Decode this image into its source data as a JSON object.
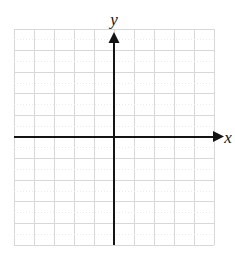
{
  "figure": {
    "name": "blank-cartesian-coordinate-plane",
    "background_color": "#ffffff"
  },
  "chart_data": {
    "type": "scatter",
    "title": "",
    "subtitle": "",
    "xlabel": "x",
    "ylabel": "y",
    "x": [],
    "y": [],
    "series": [],
    "annotations": [],
    "legend": null,
    "legend_position": "none",
    "grid": true,
    "grid_color": "#d8d8d8",
    "grid_step": 1,
    "axis_color": "#141414",
    "xlim": [
      -5,
      5
    ],
    "ylim": [
      -5,
      5
    ],
    "xticks": [
      -5,
      -4,
      -3,
      -2,
      -1,
      0,
      1,
      2,
      3,
      4,
      5
    ],
    "yticks": [
      -5,
      -4,
      -3,
      -2,
      -1,
      0,
      1,
      2,
      3,
      4,
      5
    ],
    "xtick_labels": [],
    "ytick_labels": [],
    "columns": 10,
    "rows": 10,
    "origin": {
      "x": 0,
      "y": 0
    },
    "arrows": {
      "x_positive": true,
      "y_positive": true
    }
  },
  "labels": {
    "y_axis": "y",
    "x_axis": "x"
  },
  "geometry": {
    "grid_left": 14,
    "grid_top": 29,
    "grid_right": 214,
    "grid_bottom": 245,
    "cell_width": 20,
    "cell_height": 21.6,
    "origin_px_x": 114,
    "origin_px_y": 136.6,
    "x_arrow_tip": 224,
    "y_arrow_tip": 32
  }
}
